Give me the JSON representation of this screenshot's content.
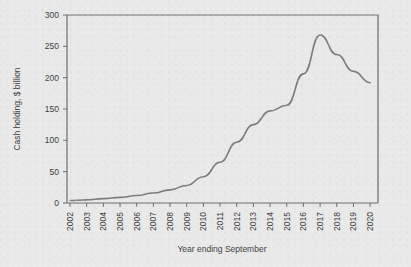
{
  "chart_data": {
    "type": "line",
    "title": "",
    "xlabel": "Year ending September",
    "ylabel": "Cash holding, $ billion",
    "categories": [
      "2002",
      "2003",
      "2004",
      "2005",
      "2006",
      "2007",
      "2008",
      "2009",
      "2010",
      "2011",
      "2012",
      "2013",
      "2014",
      "2015",
      "2016",
      "2017",
      "2018",
      "2019",
      "2020"
    ],
    "values": [
      4,
      5,
      7,
      9,
      12,
      16,
      21,
      28,
      42,
      65,
      97,
      125,
      147,
      156,
      206,
      268,
      237,
      210,
      192
    ],
    "series": [
      {
        "name": "Cash holding",
        "values": [
          4,
          5,
          7,
          9,
          12,
          16,
          21,
          28,
          42,
          65,
          97,
          125,
          147,
          156,
          206,
          268,
          237,
          210,
          192
        ],
        "color": "#7d7d7d"
      }
    ],
    "ylim": [
      0,
      300
    ],
    "yticks": [
      0,
      50,
      100,
      150,
      200,
      250,
      300
    ],
    "ytick_labels": [
      "0",
      "50",
      "100",
      "150",
      "200",
      "250",
      "300"
    ],
    "xtick_labels": [
      "2002",
      "2003",
      "2004",
      "2005",
      "2006",
      "2007",
      "2008",
      "2009",
      "2010",
      "2011",
      "2012",
      "2013",
      "2014",
      "2015",
      "2016",
      "2017",
      "2018",
      "2019",
      "2020"
    ],
    "xtick_rotation": 90,
    "grid": false,
    "legend": false,
    "legend_position": "none",
    "line_color": "#7d7d7d",
    "axis_color": "#6e6e6e",
    "background_color": "#e9e9e9",
    "text_color": "#3d3d3d"
  }
}
